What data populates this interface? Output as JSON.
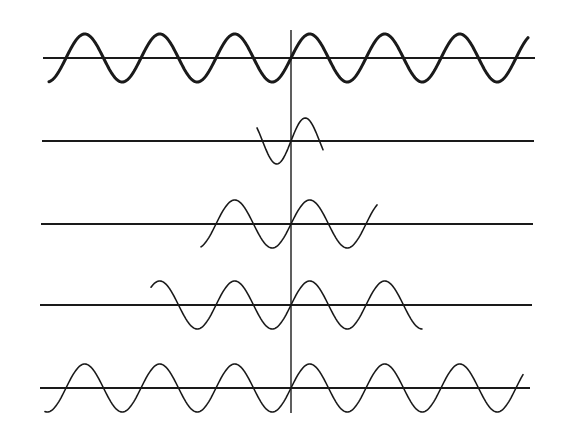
{
  "figure": {
    "width": 568,
    "height": 442,
    "background": "#ffffff",
    "ink": "#1a1a1a",
    "vertical_axis": {
      "x": 291,
      "y1": 30,
      "y2": 413
    },
    "rows": [
      {
        "name": "full-wave-top",
        "axis_y": 58,
        "axis_x1": 43,
        "axis_x2": 535,
        "amplitude": 24,
        "period": 75,
        "x_start": 49,
        "x_end": 528,
        "origin_x": 291,
        "stroke": 3
      },
      {
        "name": "short-packet",
        "axis_y": 141,
        "axis_x1": 42,
        "axis_x2": 534,
        "amplitude": 23,
        "period": 57,
        "x_start": 257,
        "x_end": 323,
        "origin_x": 291,
        "stroke": 1.6
      },
      {
        "name": "medium-packet",
        "axis_y": 224,
        "axis_x1": 41,
        "axis_x2": 533,
        "amplitude": 24,
        "period": 75,
        "x_start": 201,
        "x_end": 377,
        "origin_x": 291,
        "stroke": 1.6
      },
      {
        "name": "long-packet",
        "axis_y": 305,
        "axis_x1": 40,
        "axis_x2": 532,
        "amplitude": 24,
        "period": 75,
        "x_start": 151,
        "x_end": 422,
        "origin_x": 291,
        "stroke": 1.6
      },
      {
        "name": "full-wave-bottom",
        "axis_y": 388,
        "axis_x1": 40,
        "axis_x2": 530,
        "amplitude": 24,
        "period": 75,
        "x_start": 45,
        "x_end": 523,
        "origin_x": 291,
        "stroke": 1.6
      }
    ]
  }
}
